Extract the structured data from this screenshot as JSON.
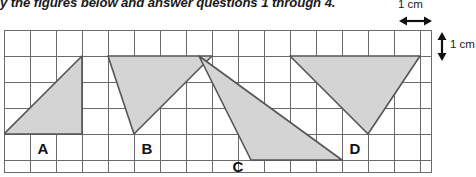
{
  "instruction": {
    "text": "y the figures below and answer questions 1 through 4."
  },
  "scale": {
    "horizontal_label": "1 cm",
    "vertical_label": "1 cm",
    "horizontal_arrow_icon": "double-arrow-horizontal-icon",
    "vertical_arrow_icon": "double-arrow-vertical-icon"
  },
  "grid": {
    "cell_size_px": 26,
    "cols": 17,
    "rows": 5.5,
    "line_color": "#6b6b6b",
    "background": "#ffffff"
  },
  "figures": [
    {
      "label": "A",
      "shape": "triangle",
      "fill": "#d4d4d4",
      "stroke": "#555555",
      "points_cells": [
        [
          0,
          4
        ],
        [
          3,
          4
        ],
        [
          3,
          1
        ]
      ],
      "label_cell": [
        1.5,
        4.55
      ]
    },
    {
      "label": "B",
      "shape": "triangle",
      "fill": "#d4d4d4",
      "stroke": "#555555",
      "points_cells": [
        [
          4,
          1
        ],
        [
          8,
          1
        ],
        [
          5,
          4
        ]
      ],
      "label_cell": [
        5.5,
        4.55
      ]
    },
    {
      "label": "C",
      "shape": "triangle",
      "fill": "#d4d4d4",
      "stroke": "#555555",
      "points_cells": [
        [
          7.5,
          1
        ],
        [
          9.5,
          4.5
        ],
        [
          13,
          4.5
        ]
      ],
      "label_cell": [
        9.0,
        5.2
      ]
    },
    {
      "label": "D",
      "shape": "triangle",
      "fill": "#d4d4d4",
      "stroke": "#555555",
      "points_cells": [
        [
          11,
          1
        ],
        [
          17,
          1
        ],
        [
          14,
          4
        ]
      ],
      "label_cell": [
        13.5,
        4.6
      ]
    }
  ]
}
